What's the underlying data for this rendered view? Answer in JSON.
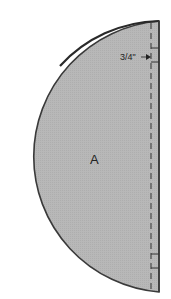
{
  "diagram": {
    "type": "sewing-pattern-piece",
    "shape": "half-circle",
    "piece_label": "A",
    "seam_allowance_label": "3/4\"",
    "colors": {
      "fill": "#b5b5b5",
      "outline": "#3a3a3a",
      "seam_line": "#333333",
      "background": "#ffffff"
    }
  }
}
